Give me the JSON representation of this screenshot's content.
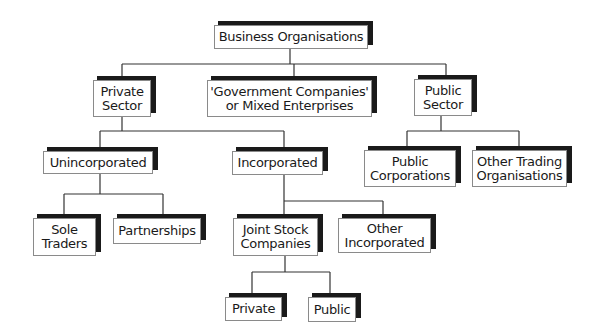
{
  "diagram": {
    "type": "organisational-tree",
    "nodes": [
      {
        "id": "root",
        "label": "Business Organisations",
        "x": 214,
        "y": 25,
        "w": 154,
        "h": 24
      },
      {
        "id": "private-sector",
        "label": "Private\nSector",
        "x": 93,
        "y": 80,
        "w": 58,
        "h": 37
      },
      {
        "id": "government-companies",
        "label": "'Government Companies'\nor Mixed Enterprises",
        "x": 207,
        "y": 80,
        "w": 165,
        "h": 37
      },
      {
        "id": "public-sector",
        "label": "Public\nSector",
        "x": 414,
        "y": 79,
        "w": 58,
        "h": 37
      },
      {
        "id": "unincorporated",
        "label": "Unincorporated",
        "x": 43,
        "y": 151,
        "w": 110,
        "h": 23
      },
      {
        "id": "incorporated",
        "label": "Incorporated",
        "x": 232,
        "y": 151,
        "w": 91,
        "h": 24
      },
      {
        "id": "public-corporations",
        "label": "Public\nCorporations",
        "x": 364,
        "y": 150,
        "w": 92,
        "h": 37
      },
      {
        "id": "other-trading-organisations",
        "label": "Other Trading\nOrganisations",
        "x": 472,
        "y": 150,
        "w": 95,
        "h": 37
      },
      {
        "id": "sole-traders",
        "label": "Sole\nTraders",
        "x": 33,
        "y": 218,
        "w": 63,
        "h": 38
      },
      {
        "id": "partnerships",
        "label": "Partnerships",
        "x": 113,
        "y": 218,
        "w": 88,
        "h": 26
      },
      {
        "id": "joint-stock-companies",
        "label": "Joint Stock\nCompanies",
        "x": 233,
        "y": 218,
        "w": 85,
        "h": 38
      },
      {
        "id": "other-incorporated",
        "label": "Other\nIncorporated",
        "x": 338,
        "y": 218,
        "w": 93,
        "h": 35
      },
      {
        "id": "private",
        "label": "Private",
        "x": 225,
        "y": 297,
        "w": 57,
        "h": 24
      },
      {
        "id": "public",
        "label": "Public",
        "x": 308,
        "y": 297,
        "w": 48,
        "h": 25
      }
    ],
    "connectors": [
      {
        "x1": 290,
        "y1": 49,
        "x2": 290,
        "y2": 64
      },
      {
        "x1": 122,
        "y1": 64,
        "x2": 446,
        "y2": 64
      },
      {
        "x1": 122,
        "y1": 64,
        "x2": 122,
        "y2": 80
      },
      {
        "x1": 294,
        "y1": 64,
        "x2": 294,
        "y2": 80
      },
      {
        "x1": 446,
        "y1": 64,
        "x2": 446,
        "y2": 79
      },
      {
        "x1": 122,
        "y1": 117,
        "x2": 122,
        "y2": 131
      },
      {
        "x1": 100,
        "y1": 131,
        "x2": 284,
        "y2": 131
      },
      {
        "x1": 100,
        "y1": 131,
        "x2": 100,
        "y2": 151
      },
      {
        "x1": 284,
        "y1": 131,
        "x2": 284,
        "y2": 151
      },
      {
        "x1": 441,
        "y1": 116,
        "x2": 441,
        "y2": 131
      },
      {
        "x1": 407,
        "y1": 131,
        "x2": 519,
        "y2": 131
      },
      {
        "x1": 407,
        "y1": 131,
        "x2": 407,
        "y2": 150
      },
      {
        "x1": 519,
        "y1": 131,
        "x2": 519,
        "y2": 150
      },
      {
        "x1": 100,
        "y1": 174,
        "x2": 100,
        "y2": 194
      },
      {
        "x1": 64,
        "y1": 194,
        "x2": 163,
        "y2": 194
      },
      {
        "x1": 64,
        "y1": 194,
        "x2": 64,
        "y2": 218
      },
      {
        "x1": 163,
        "y1": 194,
        "x2": 163,
        "y2": 218
      },
      {
        "x1": 284,
        "y1": 175,
        "x2": 284,
        "y2": 218
      },
      {
        "x1": 284,
        "y1": 201,
        "x2": 383,
        "y2": 201
      },
      {
        "x1": 383,
        "y1": 201,
        "x2": 383,
        "y2": 218
      },
      {
        "x1": 285,
        "y1": 256,
        "x2": 285,
        "y2": 272
      },
      {
        "x1": 252,
        "y1": 272,
        "x2": 330,
        "y2": 272
      },
      {
        "x1": 252,
        "y1": 272,
        "x2": 252,
        "y2": 297
      },
      {
        "x1": 330,
        "y1": 272,
        "x2": 330,
        "y2": 297
      }
    ]
  }
}
